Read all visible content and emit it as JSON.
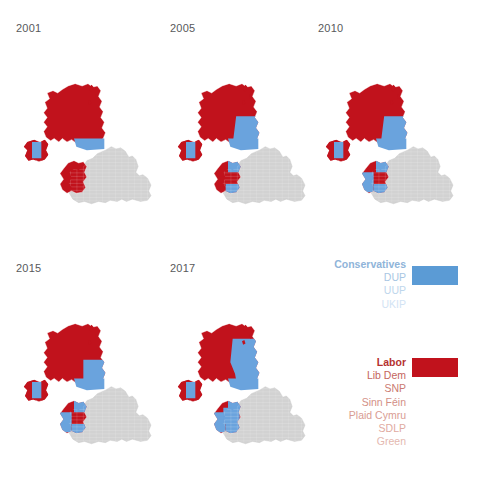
{
  "figure": {
    "background": "#ffffff",
    "type": "small-multiples-choropleth-map",
    "region": "United Kingdom"
  },
  "panels": [
    {
      "year": "2001",
      "x": 16,
      "y": 22
    },
    {
      "year": "2005",
      "x": 170,
      "y": 22
    },
    {
      "year": "2010",
      "x": 318,
      "y": 22
    },
    {
      "year": "2015",
      "x": 16,
      "y": 262
    },
    {
      "year": "2017",
      "x": 170,
      "y": 262
    }
  ],
  "legend": {
    "blue_group": {
      "swatch_color": "#5b9bd5",
      "items": [
        {
          "label": "Conservatives",
          "color": "#8fb4d9",
          "bold": true
        },
        {
          "label": "DUP",
          "color": "#a8c6e3",
          "bold": false
        },
        {
          "label": "UUP",
          "color": "#bed6ec",
          "bold": false
        },
        {
          "label": "UKIP",
          "color": "#d2e3f4",
          "bold": false
        }
      ]
    },
    "red_group": {
      "swatch_color": "#c1121c",
      "items": [
        {
          "label": "Labor",
          "color": "#b5322f",
          "bold": true
        },
        {
          "label": "Lib Dem",
          "color": "#c4655e",
          "bold": false
        },
        {
          "label": "SNP",
          "color": "#cb7a72",
          "bold": false
        },
        {
          "label": "Sinn Féin",
          "color": "#d38f86",
          "bold": false
        },
        {
          "label": "Plaid Cymru",
          "color": "#d99c93",
          "bold": false
        },
        {
          "label": "SDLP",
          "color": "#dfaaa1",
          "bold": false
        },
        {
          "label": "Green",
          "color": "#e4b8b0",
          "bold": false
        }
      ]
    }
  },
  "chart_data": {
    "type": "heatmap",
    "title": "",
    "subtitle": "",
    "xlabel": "",
    "ylabel": "",
    "legend_position": "right-middle",
    "grid": false,
    "colors": {
      "red": "#c1121c",
      "blue": "#6aa3dd",
      "grey": "#d2d2d2",
      "grey_border": "#c2c2c2"
    },
    "categories": [
      "2001",
      "2005",
      "2010",
      "2015",
      "2017"
    ],
    "series": [
      {
        "name": "Red bloc (Labour/SNP/Plaid/SDLP/Sinn Féin) share of coloured area",
        "values": [
          88,
          82,
          74,
          80,
          55
        ]
      },
      {
        "name": "Blue bloc (Conservatives/DUP/UUP/UKIP) share of coloured area",
        "values": [
          12,
          18,
          26,
          20,
          45
        ]
      }
    ],
    "regions": [
      "Scotland",
      "Northern Ireland",
      "Wales",
      "England"
    ],
    "notes": [
      "2001: Scotland almost entirely red; Wales red; Northern Ireland mixed red and blue.",
      "2005: Scotland red with small blue pockets in the south-east; Wales red with blue edges.",
      "2010: Scotland red with growing blue areas; Wales shows more blue along the coast.",
      "2015: Scotland red; Wales mixed red and blue; Northern Ireland mixed.",
      "2017: Scotland shows extensive blue in the east and south; Wales heavily mixed."
    ]
  }
}
